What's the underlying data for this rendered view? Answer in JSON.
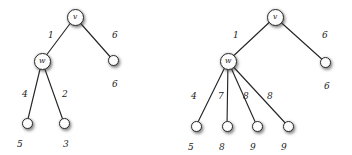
{
  "figure": {
    "background_color": "#ffffff",
    "node_fill_color": "#fdfdfd",
    "node_stroke_color": "#2b2b2b",
    "edge_color": "#262626",
    "label_color": "#1a1a1a"
  },
  "trees": [
    {
      "name": "left-tree",
      "nodes": [
        {
          "id": "v",
          "label": "v",
          "kind": "inner",
          "x": 75,
          "y": 17
        },
        {
          "id": "w",
          "label": "w",
          "kind": "inner",
          "x": 42,
          "y": 61
        },
        {
          "id": "r1",
          "label": "",
          "kind": "leaf",
          "x": 113,
          "y": 60,
          "value": "6"
        },
        {
          "id": "l1",
          "label": "",
          "kind": "leaf",
          "x": 27,
          "y": 123,
          "value": "5"
        },
        {
          "id": "l2",
          "label": "",
          "kind": "leaf",
          "x": 64,
          "y": 123,
          "value": "3"
        }
      ],
      "edges": [
        {
          "from": "v",
          "to": "w",
          "weight": "1",
          "wx": 48,
          "wy": 31
        },
        {
          "from": "v",
          "to": "r1",
          "weight": "6",
          "wx": 112,
          "wy": 31
        },
        {
          "from": "w",
          "to": "l1",
          "weight": "4",
          "wx": 22,
          "wy": 90
        },
        {
          "from": "w",
          "to": "l2",
          "weight": "2",
          "wx": 62,
          "wy": 90
        }
      ],
      "leaf_values": [
        {
          "for": "r1",
          "text": "6",
          "x": 112,
          "y": 80
        },
        {
          "for": "l1",
          "text": "5",
          "x": 17,
          "y": 140
        },
        {
          "for": "l2",
          "text": "3",
          "x": 63,
          "y": 140
        }
      ]
    },
    {
      "name": "right-tree",
      "nodes": [
        {
          "id": "v",
          "label": "v",
          "kind": "inner",
          "x": 275,
          "y": 17
        },
        {
          "id": "w",
          "label": "w",
          "kind": "inner",
          "x": 228,
          "y": 61
        },
        {
          "id": "r1",
          "label": "",
          "kind": "leaf",
          "x": 325,
          "y": 62,
          "value": "6"
        },
        {
          "id": "l1",
          "label": "",
          "kind": "leaf",
          "x": 196,
          "y": 126,
          "value": "5"
        },
        {
          "id": "l2",
          "label": "",
          "kind": "leaf",
          "x": 227,
          "y": 126,
          "value": "8"
        },
        {
          "id": "l3",
          "label": "",
          "kind": "leaf",
          "x": 257,
          "y": 126,
          "value": "9"
        },
        {
          "id": "l4",
          "label": "",
          "kind": "leaf",
          "x": 288,
          "y": 126,
          "value": "9"
        }
      ],
      "edges": [
        {
          "from": "v",
          "to": "w",
          "weight": "1",
          "wx": 233,
          "wy": 31
        },
        {
          "from": "v",
          "to": "r1",
          "weight": "6",
          "wx": 322,
          "wy": 31
        },
        {
          "from": "w",
          "to": "l1",
          "weight": "4",
          "wx": 191,
          "wy": 92
        },
        {
          "from": "w",
          "to": "l2",
          "weight": "7",
          "wx": 218,
          "wy": 92
        },
        {
          "from": "w",
          "to": "l3",
          "weight": "8",
          "wx": 243,
          "wy": 92
        },
        {
          "from": "w",
          "to": "l4",
          "weight": "8",
          "wx": 267,
          "wy": 92
        }
      ],
      "leaf_values": [
        {
          "for": "r1",
          "text": "6",
          "x": 324,
          "y": 82
        },
        {
          "for": "l1",
          "text": "5",
          "x": 188,
          "y": 143
        },
        {
          "for": "l2",
          "text": "8",
          "x": 219,
          "y": 143
        },
        {
          "for": "l3",
          "text": "9",
          "x": 250,
          "y": 143
        },
        {
          "for": "l4",
          "text": "9",
          "x": 281,
          "y": 143
        }
      ]
    }
  ]
}
